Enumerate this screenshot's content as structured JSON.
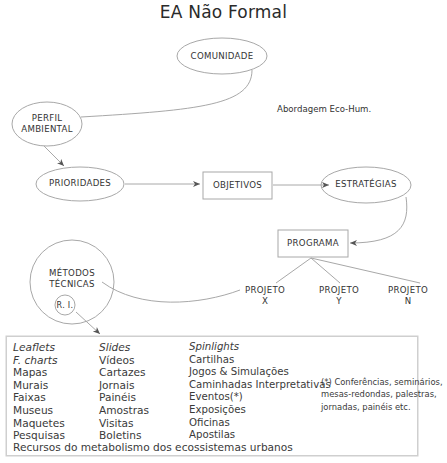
{
  "title": "EA Não Formal",
  "approach_note": "Abordagem Eco-Hum.",
  "nodes": {
    "comunidade": "COMUNIDADE",
    "perfil_line1": "PERFIL",
    "perfil_line2": "AMBIENTAL",
    "prioridades": "PRIORIDADES",
    "objetivos": "OBJETIVOS",
    "estrategias": "ESTRATÉGIAS",
    "programa": "PROGRAMA",
    "metodos_line1": "MÉTODOS",
    "metodos_line2": "TÉCNICAS",
    "ri": "R. I.",
    "projetos": [
      {
        "line1": "PROJETO",
        "line2": "X"
      },
      {
        "line1": "PROJETO",
        "line2": "Y"
      },
      {
        "line1": "PROJETO",
        "line2": "N"
      }
    ]
  },
  "resources": {
    "columns": [
      {
        "items": [
          {
            "text": "Leaflets",
            "italic": true
          },
          {
            "text": "F. charts",
            "italic": true
          },
          {
            "text": "Mapas"
          },
          {
            "text": "Murais"
          },
          {
            "text": "Faixas"
          },
          {
            "text": "Museus"
          },
          {
            "text": "Maquetes"
          },
          {
            "text": "Pesquisas"
          }
        ]
      },
      {
        "items": [
          {
            "text": "Slides",
            "italic": true
          },
          {
            "text": "Vídeos"
          },
          {
            "text": "Cartazes"
          },
          {
            "text": "Jornais"
          },
          {
            "text": "Painéis"
          },
          {
            "text": "Amostras"
          },
          {
            "text": "Visitas"
          },
          {
            "text": "Boletins"
          }
        ]
      },
      {
        "items": [
          {
            "text": "Spinlights",
            "italic": true
          },
          {
            "text": "Cartilhas"
          },
          {
            "text": "Jogos & Simulações"
          },
          {
            "text": "Caminhadas Interpretativas"
          },
          {
            "text": "Eventos(*)"
          },
          {
            "text": "Exposições"
          },
          {
            "text": "Oficinas"
          },
          {
            "text": "Apostilas"
          }
        ]
      }
    ],
    "footer": "Recursos do metabolismo dos ecossistemas urbanos"
  },
  "footnote": {
    "line1": "(*) Conferências, seminários,",
    "line2": "mesas-redondas,  palestras,",
    "line3": "jornadas, painéis etc."
  },
  "colors": {
    "stroke": "#9a9a9a",
    "text": "#333333"
  }
}
